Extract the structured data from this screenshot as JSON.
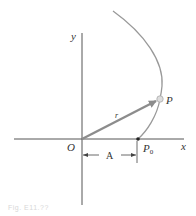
{
  "figure": {
    "type": "kinematics-diagram",
    "axes": {
      "x_label": "x",
      "y_label": "y",
      "origin_label": "O"
    },
    "points": {
      "start_label": "P",
      "start_subscript": "0",
      "moving_label": "P"
    },
    "vector": {
      "label": "r"
    },
    "dimension": {
      "label": "A"
    },
    "colors": {
      "axis": "#555555",
      "curve": "#999999",
      "vector": "#8c8c8c",
      "point_fill": "#dddddd",
      "start_point": "#222222",
      "text": "#333333"
    },
    "caption": "Fig. E11.??"
  }
}
